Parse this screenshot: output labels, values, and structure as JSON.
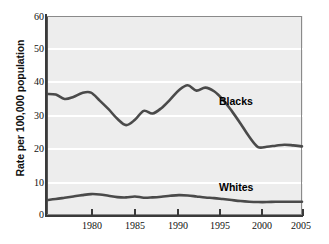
{
  "chart_data": {
    "type": "line",
    "title": "",
    "xlabel": "",
    "ylabel": "Rate per 100,000 population",
    "xlim": [
      1976,
      2005
    ],
    "ylim": [
      0,
      60
    ],
    "grid": true,
    "legend_position": "inline-annotation",
    "xticks": [
      1980,
      1985,
      1990,
      1995,
      2000,
      2005
    ],
    "yticks": [
      0,
      10,
      20,
      30,
      40,
      50,
      60
    ],
    "x": [
      1976,
      1977,
      1978,
      1979,
      1980,
      1981,
      1982,
      1983,
      1984,
      1985,
      1986,
      1987,
      1988,
      1989,
      1990,
      1991,
      1992,
      1993,
      1994,
      1995,
      1996,
      1997,
      1998,
      1999,
      2000,
      2001,
      2002,
      2003,
      2004,
      2005
    ],
    "series": [
      {
        "name": "Blacks",
        "values": [
          36.5,
          36.3,
          35.0,
          35.6,
          36.8,
          36.9,
          34.5,
          31.9,
          29.0,
          27.1,
          28.7,
          31.4,
          30.6,
          32.2,
          34.8,
          37.6,
          39.1,
          37.5,
          38.4,
          37.3,
          34.8,
          31.4,
          27.6,
          23.6,
          20.5,
          20.6,
          20.9,
          21.2,
          21.0,
          20.7
        ]
      },
      {
        "name": "Whites",
        "values": [
          4.5,
          4.8,
          5.2,
          5.6,
          6.0,
          6.3,
          6.2,
          5.8,
          5.4,
          5.3,
          5.6,
          5.2,
          5.3,
          5.5,
          5.8,
          6.0,
          5.9,
          5.6,
          5.3,
          5.1,
          4.8,
          4.5,
          4.2,
          4.0,
          3.9,
          3.9,
          4.0,
          4.0,
          4.0,
          4.0
        ]
      }
    ]
  },
  "axes": {
    "y_title": "Rate per 100,000 population",
    "y_labels": [
      "60",
      "50",
      "40",
      "30",
      "20",
      "10",
      "0"
    ],
    "x_labels": [
      "1980",
      "1985",
      "1990",
      "1995",
      "2000",
      "2005"
    ]
  },
  "annotations": {
    "blacks_label": "Blacks",
    "whites_label": "Whites"
  },
  "colors": {
    "plot_background": "#ededed",
    "gridline": "#ffffff",
    "series_stroke": "#4a4a4a",
    "axis": "#3a3a3a",
    "text": "#111111"
  }
}
